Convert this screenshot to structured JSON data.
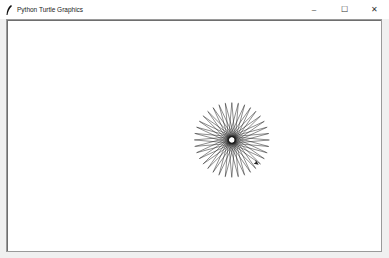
{
  "window": {
    "title": "Python Turtle Graphics",
    "icon": "feather-icon",
    "controls": {
      "minimize": "–",
      "maximize": "☐",
      "close": "✕"
    }
  },
  "canvas": {
    "background": "#ffffff",
    "drawing": {
      "shape": "starburst",
      "center_x": 232,
      "center_y": 140,
      "radius": 38,
      "rays": 36,
      "stroke": "#1a1a1a"
    },
    "turtle": {
      "shape": "classic-arrow",
      "x": 259,
      "y": 165
    }
  }
}
